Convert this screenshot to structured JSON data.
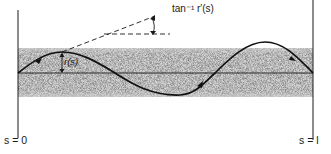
{
  "figure": {
    "labels": {
      "angle": "tan⁻¹ r′(s)",
      "radius": "r(s)",
      "start": "s = 0",
      "end": "s = l"
    },
    "colors": {
      "ink": "#1a1a1a",
      "band": "#b9b9b9",
      "background": "#ffffff"
    },
    "geometry": {
      "left_boundary_x": 18,
      "right_boundary_x": 313,
      "axis_y": 73,
      "band_top_y": 48,
      "band_bottom_y": 97
    }
  }
}
